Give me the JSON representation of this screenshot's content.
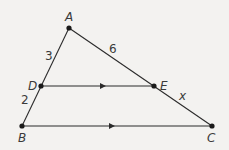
{
  "diagram": {
    "type": "triangle-parallel-segment",
    "points": {
      "A": {
        "label": "A",
        "x": 69,
        "y": 28
      },
      "B": {
        "label": "B",
        "x": 22,
        "y": 126
      },
      "C": {
        "label": "C",
        "x": 212,
        "y": 126
      },
      "D": {
        "label": "D",
        "x": 41,
        "y": 86
      },
      "E": {
        "label": "E",
        "x": 154,
        "y": 86
      }
    },
    "segment_labels": {
      "AD": "3",
      "DB": "2",
      "AE": "6",
      "EC": "x"
    },
    "parallel": [
      "DE",
      "BC"
    ],
    "colors": {
      "line": "#2b2b2b",
      "point": "#1a1a1a",
      "background": "#f3f2f0"
    }
  }
}
